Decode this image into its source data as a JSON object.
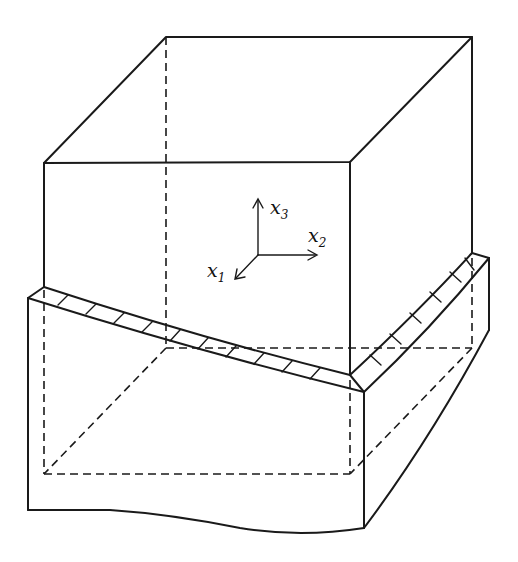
{
  "figure": {
    "axes": {
      "x1": {
        "base": "x",
        "sub": "1"
      },
      "x2": {
        "base": "x",
        "sub": "2"
      },
      "x3": {
        "base": "x",
        "sub": "3"
      }
    },
    "colors": {
      "ink": "#1a1a1a",
      "background": "#ffffff"
    }
  }
}
